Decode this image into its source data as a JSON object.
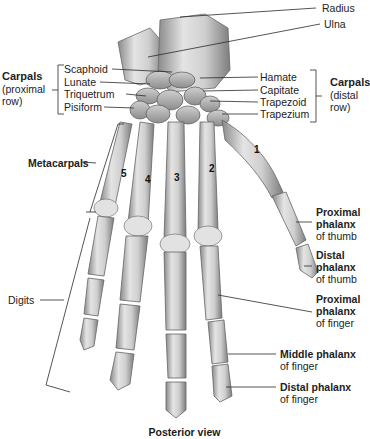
{
  "figure": {
    "caption": "Posterior view",
    "colors": {
      "bone_light": "#e6e6e6",
      "bone_mid": "#bdbdbd",
      "bone_dark": "#7a7a7a",
      "line": "#333333",
      "text": "#222222"
    }
  },
  "labels": {
    "forearm": {
      "radius": "Radius",
      "ulna": "Ulna"
    },
    "carpals_proximal": {
      "title": "Carpals",
      "subtitle_line1": "(proximal",
      "subtitle_line2": "row)",
      "items": [
        "Scaphoid",
        "Lunate",
        "Triquetrum",
        "Pisiform"
      ]
    },
    "carpals_distal": {
      "title": "Carpals",
      "subtitle_line1": "(distal",
      "subtitle_line2": "row)",
      "items": [
        "Hamate",
        "Capitate",
        "Trapezoid",
        "Trapezium"
      ]
    },
    "metacarpals": "Metacarpals",
    "digits": "Digits",
    "metacarpal_numbers": [
      "1",
      "2",
      "3",
      "4",
      "5"
    ],
    "thumb": {
      "proximal": {
        "line1": "Proximal",
        "line2": "phalanx",
        "line3": "of thumb"
      },
      "distal": {
        "line1": "Distal",
        "line2": "phalanx",
        "line3": "of thumb"
      }
    },
    "finger": {
      "proximal": {
        "line1": "Proximal",
        "line2": "phalanx",
        "line3": "of finger"
      },
      "middle": {
        "line1": "Middle phalanx",
        "line2": "of finger"
      },
      "distal": {
        "line1": "Distal phalanx",
        "line2": "of finger"
      }
    }
  }
}
